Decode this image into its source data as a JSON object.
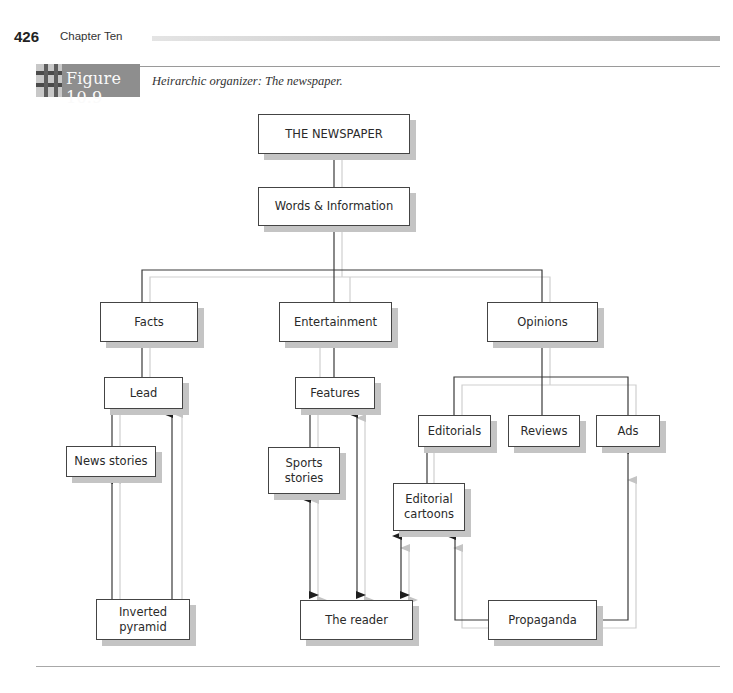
{
  "page_header": {
    "page_number": "426",
    "chapter_title": "Chapter Ten"
  },
  "figure": {
    "label": "Figure 10.9",
    "caption": "Heirarchic organizer: The newspaper."
  },
  "diagram": {
    "nodes": {
      "root": "THE NEWSPAPER",
      "words": "Words & Information",
      "facts": "Facts",
      "entertainment": "Entertainment",
      "opinions": "Opinions",
      "lead": "Lead",
      "features": "Features",
      "news_stories": "News stories",
      "sports_stories": "Sports stories",
      "editorials": "Editorials",
      "reviews": "Reviews",
      "ads": "Ads",
      "editorial_cartoons": "Editorial cartoons",
      "inverted_pyramid": "Inverted pyramid",
      "the_reader": "The reader",
      "propaganda": "Propaganda"
    },
    "edges": [
      {
        "from": "THE NEWSPAPER",
        "to": "Words & Information",
        "type": "line"
      },
      {
        "from": "Words & Information",
        "to": "Facts",
        "type": "line"
      },
      {
        "from": "Words & Information",
        "to": "Entertainment",
        "type": "line"
      },
      {
        "from": "Words & Information",
        "to": "Opinions",
        "type": "line"
      },
      {
        "from": "Facts",
        "to": "Lead",
        "type": "line"
      },
      {
        "from": "Lead",
        "to": "News stories",
        "type": "line"
      },
      {
        "from": "Inverted pyramid",
        "to": "News stories",
        "type": "arrow"
      },
      {
        "from": "Inverted pyramid",
        "to": "Lead",
        "type": "arrow"
      },
      {
        "from": "Entertainment",
        "to": "Features",
        "type": "line"
      },
      {
        "from": "Features",
        "to": "Sports stories",
        "type": "line"
      },
      {
        "from": "Sports stories",
        "to": "The reader",
        "type": "double-arrow"
      },
      {
        "from": "Features",
        "to": "The reader",
        "type": "double-arrow"
      },
      {
        "from": "Opinions",
        "to": "Editorials",
        "type": "line"
      },
      {
        "from": "Opinions",
        "to": "Reviews",
        "type": "line"
      },
      {
        "from": "Opinions",
        "to": "Ads",
        "type": "line"
      },
      {
        "from": "Editorials",
        "to": "Editorial cartoons",
        "type": "line"
      },
      {
        "from": "Editorial cartoons",
        "to": "The reader",
        "type": "double-arrow"
      },
      {
        "from": "Propaganda",
        "to": "Editorial cartoons",
        "type": "arrow"
      },
      {
        "from": "Propaganda",
        "to": "Ads",
        "type": "arrow"
      }
    ]
  },
  "colors": {
    "line_dark": "#3a3a3a",
    "line_light": "#c8c8c8",
    "shadow": "#c4c4c4",
    "badge": "#8e8e8e"
  }
}
